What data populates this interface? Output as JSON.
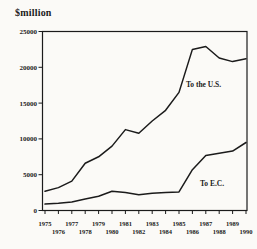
{
  "chart_data": {
    "type": "line",
    "title": "",
    "ylabel": "$million",
    "xlabel": "",
    "x": [
      1975,
      1976,
      1977,
      1978,
      1979,
      1980,
      1981,
      1982,
      1983,
      1984,
      1985,
      1986,
      1987,
      1988,
      1989,
      1990
    ],
    "x_tick_rows": [
      [
        "1975",
        "1977",
        "1979",
        "1981",
        "1983",
        "1985",
        "1987",
        "1989"
      ],
      [
        "1976",
        "1978",
        "1980",
        "1982",
        "1984",
        "1986",
        "1988",
        "1990"
      ]
    ],
    "y_ticks": [
      0,
      5000,
      10000,
      15000,
      20000,
      25000
    ],
    "xlim": [
      1975,
      1990
    ],
    "ylim": [
      0,
      25000
    ],
    "grid": false,
    "legend_position": "inline-annotations",
    "line_color": "#1b1b1b",
    "series": [
      {
        "name": "To the U.S.",
        "values": [
          2700,
          3200,
          4100,
          6600,
          7500,
          9000,
          11300,
          10800,
          12500,
          14000,
          16500,
          22500,
          22900,
          21300,
          20800,
          21200
        ]
      },
      {
        "name": "To E.C.",
        "values": [
          900,
          1000,
          1200,
          1600,
          2000,
          2700,
          2500,
          2200,
          2400,
          2500,
          2600,
          5700,
          7700,
          8000,
          8300,
          9500
        ]
      }
    ]
  }
}
